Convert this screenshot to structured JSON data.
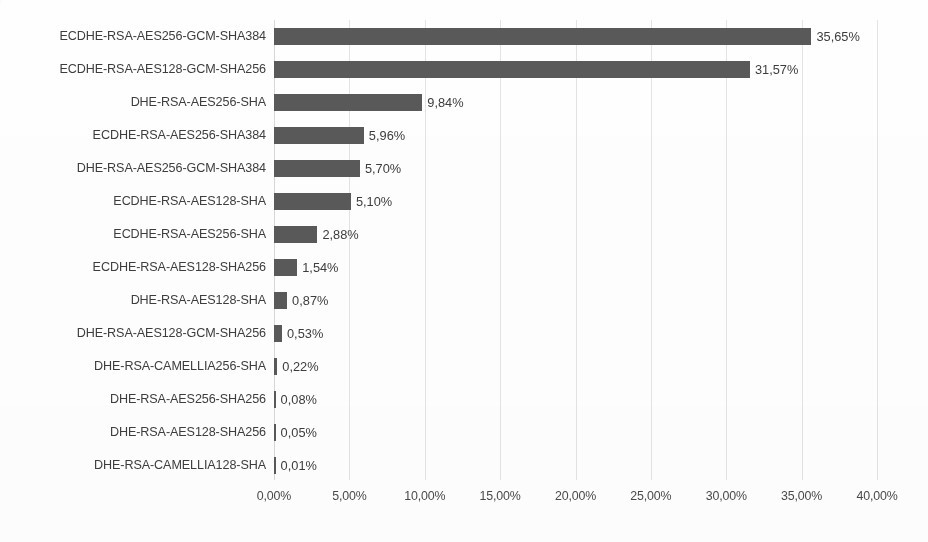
{
  "chart_data": {
    "type": "bar",
    "orientation": "horizontal",
    "title": "",
    "xlabel": "",
    "ylabel": "",
    "xlim": [
      0,
      40
    ],
    "grid": true,
    "legend": false,
    "value_suffix": "%",
    "decimal_separator": ",",
    "bar_color": "#595959",
    "gridline_color": "#e3e3e3",
    "axis_tick_labels": [
      "0,00%",
      "5,00%",
      "10,00%",
      "15,00%",
      "20,00%",
      "25,00%",
      "30,00%",
      "35,00%",
      "40,00%"
    ],
    "axis_tick_values": [
      0,
      5,
      10,
      15,
      20,
      25,
      30,
      35,
      40
    ],
    "categories": [
      "ECDHE-RSA-AES256-GCM-SHA384",
      "ECDHE-RSA-AES128-GCM-SHA256",
      "DHE-RSA-AES256-SHA",
      "ECDHE-RSA-AES256-SHA384",
      "DHE-RSA-AES256-GCM-SHA384",
      "ECDHE-RSA-AES128-SHA",
      "ECDHE-RSA-AES256-SHA",
      "ECDHE-RSA-AES128-SHA256",
      "DHE-RSA-AES128-SHA",
      "DHE-RSA-AES128-GCM-SHA256",
      "DHE-RSA-CAMELLIA256-SHA",
      "DHE-RSA-AES256-SHA256",
      "DHE-RSA-AES128-SHA256",
      "DHE-RSA-CAMELLIA128-SHA"
    ],
    "values": [
      35.65,
      31.57,
      9.84,
      5.96,
      5.7,
      5.1,
      2.88,
      1.54,
      0.87,
      0.53,
      0.22,
      0.08,
      0.05,
      0.01
    ],
    "value_labels": [
      "35,65%",
      "31,57%",
      "9,84%",
      "5,96%",
      "5,70%",
      "5,10%",
      "2,88%",
      "1,54%",
      "0,87%",
      "0,53%",
      "0,22%",
      "0,08%",
      "0,05%",
      "0,01%"
    ]
  }
}
